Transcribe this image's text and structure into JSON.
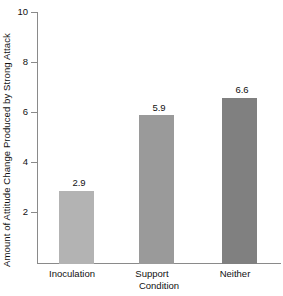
{
  "chart_data": {
    "type": "bar",
    "title": "",
    "subtitle": "",
    "xlabel": "Condition",
    "ylabel": "Amount of Attitude Change Produced by Strong Attack",
    "categories": [
      "Inoculation",
      "Support",
      "Neither"
    ],
    "values": [
      2.9,
      5.9,
      6.6
    ],
    "value_labels": [
      "2.9",
      "5.9",
      "6.6"
    ],
    "series": [
      {
        "name": "Attitude change",
        "values": [
          2.9,
          5.9,
          6.6
        ]
      }
    ],
    "ylim": [
      0,
      10
    ],
    "yticks": [
      2,
      4,
      6,
      8,
      10
    ],
    "ytick_labels": [
      "2",
      "4",
      "6",
      "8",
      "10"
    ],
    "xlim_categories": 3,
    "grid": false,
    "legend": false,
    "legend_position": "none",
    "bar_colors": [
      "#b3b3b3",
      "#9a9a9a",
      "#808080"
    ],
    "axis_color": "#8a8a8a",
    "background_color": "#ffffff",
    "text_color": "#111111"
  }
}
